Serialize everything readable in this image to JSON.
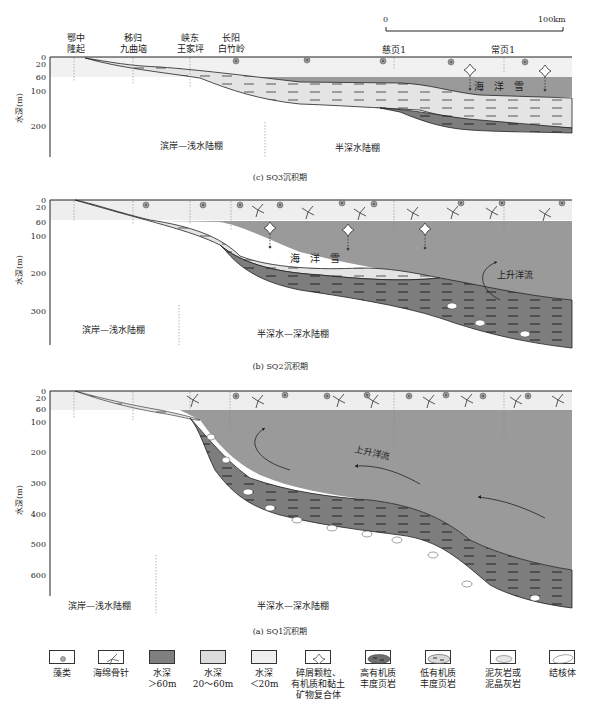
{
  "colors": {
    "deep_water": "#9a9a9a",
    "mid_water": "#e1e1e1",
    "shallow_water": "#f1f1f1",
    "high_organic_shale": "#7d7d7d",
    "low_organic_shale": "#d9d9d9",
    "outline": "#222222"
  },
  "scale_bar": {
    "start": "0",
    "end": "100km"
  },
  "locations": [
    {
      "line1": "鄂中",
      "line2": "隆起"
    },
    {
      "line1": "秭归",
      "line2": "九曲垴"
    },
    {
      "line1": "峡东",
      "line2": "王家坪"
    },
    {
      "line1": "长阳",
      "line2": "白竹岭"
    },
    {
      "line1": "慈页1",
      "line2": ""
    },
    {
      "line1": "常页1",
      "line2": ""
    }
  ],
  "panels": [
    {
      "id": "c",
      "caption": "(c) SQ3沉积期",
      "y_axis_label": "水深(m)",
      "y_ticks": [
        "0",
        "20",
        "60",
        "100",
        "200"
      ],
      "zone_left": "滨岸—浅水陆棚",
      "zone_right": "半深水陆棚",
      "annotation_snow": "海　洋　雪"
    },
    {
      "id": "b",
      "caption": "(b) SQ2沉积期",
      "y_axis_label": "水深(m)",
      "y_ticks": [
        "0",
        "20",
        "60",
        "100",
        "200",
        "300"
      ],
      "zone_left": "滨岸—浅水陆棚",
      "zone_right": "半深水—深水陆棚",
      "annotation_snow": "海　洋　雪",
      "annotation_current": "上升洋流"
    },
    {
      "id": "a",
      "caption": "(a) SQ1沉积期",
      "y_axis_label": "水深(m)",
      "y_ticks": [
        "0",
        "20",
        "60",
        "100",
        "200",
        "300",
        "400",
        "500",
        "600"
      ],
      "zone_left": "滨岸—浅水陆棚",
      "zone_right": "半深水—深水陆棚",
      "annotation_current": "上升洋流"
    }
  ],
  "legend": [
    {
      "icon": "algae-icon",
      "line1": "藻类",
      "line2": "",
      "line3": ""
    },
    {
      "icon": "sponge-spicule-icon",
      "line1": "海绵骨针",
      "line2": "",
      "line3": ""
    },
    {
      "icon": "deep-water-swatch",
      "line1": "水深",
      "line2": "＞60m",
      "line3": ""
    },
    {
      "icon": "mid-water-swatch",
      "line1": "水深",
      "line2": "20～60m",
      "line3": ""
    },
    {
      "icon": "shallow-water-swatch",
      "line1": "水深",
      "line2": "＜20m",
      "line3": ""
    },
    {
      "icon": "clastic-particle-icon",
      "line1": "碎屑颗粒、",
      "line2": "有机质和黏土",
      "line3": "矿物复合体"
    },
    {
      "icon": "high-organic-shale-swatch",
      "line1": "高有机质",
      "line2": "丰度页岩",
      "line3": ""
    },
    {
      "icon": "low-organic-shale-swatch",
      "line1": "低有机质",
      "line2": "丰度页岩",
      "line3": ""
    },
    {
      "icon": "marl-limestone-swatch",
      "line1": "泥灰岩或",
      "line2": "泥晶灰岩",
      "line3": ""
    },
    {
      "icon": "nodule-swatch",
      "line1": "结核体",
      "line2": "",
      "line3": ""
    }
  ]
}
